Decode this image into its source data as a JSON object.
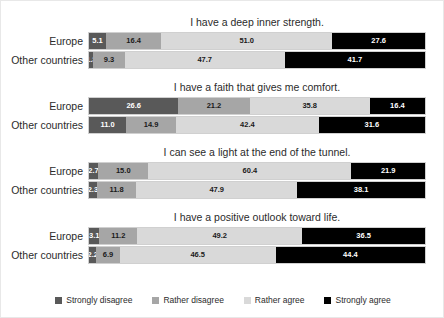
{
  "chart_data": {
    "type": "bar",
    "subtype": "stacked-horizontal-100pct",
    "title": "",
    "xlabel": "",
    "ylabel": "",
    "xlim": [
      0,
      100
    ],
    "grid": false,
    "legend_position": "bottom",
    "categories": [
      "Europe",
      "Other countries"
    ],
    "series": [
      {
        "name": "Strongly disagree",
        "color": "#595959"
      },
      {
        "name": "Rather disagree",
        "color": "#a6a6a6"
      },
      {
        "name": "Rather agree",
        "color": "#d9d9d9"
      },
      {
        "name": "Strongly agree",
        "color": "#000000"
      }
    ],
    "panels": [
      {
        "title": "I have a deep inner strength.",
        "rows": [
          {
            "label": "Europe",
            "values": [
              5.1,
              16.4,
              51.0,
              27.6
            ]
          },
          {
            "label": "Other countries",
            "values": [
              1.3,
              9.3,
              47.7,
              41.7
            ]
          }
        ]
      },
      {
        "title": "I have a faith that gives me comfort.",
        "rows": [
          {
            "label": "Europe",
            "values": [
              26.6,
              21.2,
              35.8,
              16.4
            ]
          },
          {
            "label": "Other countries",
            "values": [
              11.0,
              14.9,
              42.4,
              31.6
            ]
          }
        ]
      },
      {
        "title": "I can see a light at the end of the tunnel.",
        "rows": [
          {
            "label": "Europe",
            "values": [
              2.7,
              15.0,
              60.4,
              21.9
            ]
          },
          {
            "label": "Other countries",
            "values": [
              2.3,
              11.8,
              47.9,
              38.1
            ]
          }
        ]
      },
      {
        "title": "I have a positive outlook toward life.",
        "rows": [
          {
            "label": "Europe",
            "values": [
              3.1,
              11.2,
              49.2,
              36.5
            ]
          },
          {
            "label": "Other countries",
            "values": [
              2.2,
              6.9,
              46.5,
              44.4
            ]
          }
        ]
      }
    ]
  },
  "legend": {
    "items": [
      {
        "label": "Strongly disagree",
        "color": "#595959"
      },
      {
        "label": "Rather disagree",
        "color": "#a6a6a6"
      },
      {
        "label": "Rather agree",
        "color": "#d9d9d9"
      },
      {
        "label": "Strongly agree",
        "color": "#000000"
      }
    ]
  }
}
